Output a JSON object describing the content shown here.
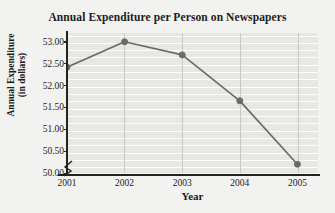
{
  "chart_data": {
    "type": "line",
    "title": "Annual Expenditure per Person on Newspapers",
    "xlabel": "Year",
    "ylabel": "Annual Expenditure",
    "ylabel_line2": "(in dollars)",
    "categories": [
      "2001",
      "2002",
      "2003",
      "2004",
      "2005"
    ],
    "values": [
      52.42,
      53.0,
      52.7,
      51.65,
      50.2
    ],
    "series": [
      {
        "name": "Annual Expenditure per Person",
        "values": [
          52.42,
          53.0,
          52.7,
          51.65,
          50.2
        ]
      }
    ],
    "ytick_labels": [
      "53.00",
      "52.50",
      "52.00",
      "51.50",
      "51.00",
      "50.50",
      "50.00"
    ],
    "ytick_values": [
      53.0,
      52.5,
      52.0,
      51.5,
      51.0,
      50.5,
      50.0
    ],
    "ylim": [
      50.0,
      53.2
    ],
    "xlim_categories": 5,
    "grid": true,
    "grid_orientation": "both",
    "axis_break": true,
    "axis_break_symbol": "zigzag",
    "legend": false,
    "legend_position": "none",
    "marker": "circle",
    "colors": {
      "line": "#6b6b6b",
      "marker": "#6b6b6b",
      "plot_background": "#e7e7e4",
      "figure_background": "#f2f2f0",
      "gridline_horizontal": "#ffffff",
      "gridline_vertical": "#c9c9c6",
      "axis": "#232323",
      "text": "#1c1c1c"
    }
  }
}
